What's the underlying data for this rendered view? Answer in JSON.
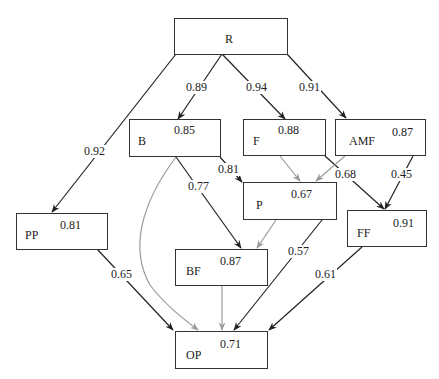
{
  "diagram": {
    "type": "path-diagram",
    "colors": {
      "black_edge": "#222222",
      "gray_edge": "#9a9a9a",
      "box_border": "#333333"
    },
    "nodes": {
      "R": {
        "label": "R",
        "value": ""
      },
      "B": {
        "label": "B",
        "value": "0.85"
      },
      "F": {
        "label": "F",
        "value": "0.88"
      },
      "AMF": {
        "label": "AMF",
        "value": "0.87"
      },
      "PP": {
        "label": "PP",
        "value": "0.81"
      },
      "P": {
        "label": "P",
        "value": "0.67"
      },
      "FF": {
        "label": "FF",
        "value": "0.91"
      },
      "BF": {
        "label": "BF",
        "value": "0.87"
      },
      "OP": {
        "label": "OP",
        "value": "0.71"
      }
    },
    "edges": [
      {
        "from": "R",
        "to": "PP",
        "weight": "0.92",
        "style": "black"
      },
      {
        "from": "R",
        "to": "B",
        "weight": "0.89",
        "style": "black"
      },
      {
        "from": "R",
        "to": "F",
        "weight": "0.94",
        "style": "black"
      },
      {
        "from": "R",
        "to": "AMF",
        "weight": "0.91",
        "style": "black"
      },
      {
        "from": "B",
        "to": "P",
        "weight": "0.81",
        "style": "black"
      },
      {
        "from": "B",
        "to": "BF",
        "weight": "0.77",
        "style": "black"
      },
      {
        "from": "B",
        "to": "OP",
        "weight": "",
        "style": "gray"
      },
      {
        "from": "F",
        "to": "P",
        "weight": "",
        "style": "gray"
      },
      {
        "from": "F",
        "to": "FF",
        "weight": "0.68",
        "style": "black"
      },
      {
        "from": "AMF",
        "to": "P",
        "weight": "",
        "style": "gray"
      },
      {
        "from": "AMF",
        "to": "FF",
        "weight": "0.45",
        "style": "black"
      },
      {
        "from": "P",
        "to": "BF",
        "weight": "",
        "style": "gray"
      },
      {
        "from": "P",
        "to": "OP",
        "weight": "0.57",
        "style": "black"
      },
      {
        "from": "PP",
        "to": "OP",
        "weight": "0.65",
        "style": "black"
      },
      {
        "from": "FF",
        "to": "OP",
        "weight": "0.61",
        "style": "black"
      },
      {
        "from": "BF",
        "to": "OP",
        "weight": "",
        "style": "gray"
      }
    ]
  }
}
